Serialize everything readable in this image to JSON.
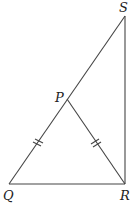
{
  "diagram": {
    "type": "geometry",
    "points": {
      "S": {
        "label": "S",
        "x": 125,
        "y": 16
      },
      "P": {
        "label": "P",
        "x": 67,
        "y": 99
      },
      "Q": {
        "label": "Q",
        "x": 9,
        "y": 184
      },
      "R": {
        "label": "R",
        "x": 125,
        "y": 184
      }
    },
    "segments": [
      "QS",
      "QR",
      "RS",
      "PR"
    ],
    "equal_marks": [
      {
        "segment": "QP",
        "ticks": 2
      },
      {
        "segment": "PR",
        "ticks": 2
      }
    ],
    "right_angle": "R"
  }
}
